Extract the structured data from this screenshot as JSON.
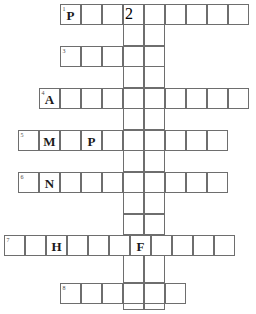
{
  "puzzle": {
    "type": "crossword",
    "title": "",
    "cell_size": 21,
    "grid_width": 256,
    "grid_height": 314,
    "across_entries": [
      {
        "number": "1",
        "row_index": 0,
        "x": 60,
        "y": 4,
        "cells": 9,
        "letters": [
          "P",
          "",
          "",
          "",
          "",
          "",
          "",
          "",
          ""
        ]
      },
      {
        "number": "3",
        "row_index": 1,
        "x": 60,
        "y": 46,
        "cells": 5,
        "letters": [
          "",
          "",
          "",
          "",
          ""
        ]
      },
      {
        "number": "4",
        "row_index": 2,
        "x": 39,
        "y": 88,
        "cells": 10,
        "letters": [
          "A",
          "",
          "",
          "",
          "",
          "",
          "",
          "",
          "",
          ""
        ]
      },
      {
        "number": "5",
        "row_index": 3,
        "x": 18,
        "y": 130,
        "cells": 10,
        "letters": [
          "",
          "M",
          "",
          "P",
          "",
          "",
          "",
          "",
          "",
          ""
        ]
      },
      {
        "number": "6",
        "row_index": 4,
        "x": 18,
        "y": 172,
        "cells": 10,
        "letters": [
          "",
          "N",
          "",
          "",
          "",
          "",
          "",
          "",
          "",
          ""
        ]
      },
      {
        "number": "7",
        "row_index": 5,
        "x": 4,
        "y": 235,
        "cells": 11,
        "letters": [
          "",
          "",
          "H",
          "",
          "",
          "",
          "F",
          "",
          "",
          "",
          ""
        ]
      },
      {
        "number": "8",
        "row_index": 6,
        "x": 60,
        "y": 283,
        "cells": 6,
        "letters": [
          "",
          "",
          "",
          "",
          "",
          ""
        ]
      }
    ],
    "down_entries": [
      {
        "number": "2",
        "x": 123,
        "y": 4,
        "cell_width": 21,
        "segments": [
          {
            "top": 4,
            "height": 42
          },
          {
            "top": 46,
            "height": 42
          },
          {
            "top": 88,
            "height": 42
          },
          {
            "top": 130,
            "height": 42
          },
          {
            "top": 172,
            "height": 42
          },
          {
            "top": 214,
            "height": 21
          },
          {
            "top": 235,
            "height": 48
          },
          {
            "top": 283,
            "height": 27
          }
        ]
      },
      {
        "number": "",
        "x": 144,
        "y": 4,
        "cell_width": 21,
        "segments": [
          {
            "top": 4,
            "height": 42
          },
          {
            "top": 46,
            "height": 42
          },
          {
            "top": 88,
            "height": 42
          },
          {
            "top": 130,
            "height": 42
          },
          {
            "top": 172,
            "height": 42
          },
          {
            "top": 214,
            "height": 21
          },
          {
            "top": 235,
            "height": 48
          },
          {
            "top": 283,
            "height": 27
          }
        ]
      }
    ],
    "colors": {
      "border": "#6e6e6e",
      "cell_background": "#ffffff",
      "letter": "#1a1a1a",
      "clue_number": "#4a4a4a",
      "page_background": "#ffffff"
    }
  }
}
